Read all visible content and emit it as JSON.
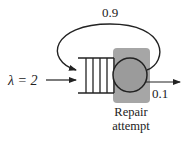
{
  "diagram": {
    "type": "queueing-network",
    "arrival": {
      "label": "λ = 2",
      "symbol": "λ",
      "rate": 2
    },
    "queue": {
      "buffer_slots": 4
    },
    "server": {
      "label_line1": "Repair",
      "label_line2": "attempt",
      "highlight_color": "#a6a6a6"
    },
    "feedback": {
      "label": "0.9",
      "probability": 0.9
    },
    "exit": {
      "label": "0.1",
      "probability": 0.1
    }
  }
}
